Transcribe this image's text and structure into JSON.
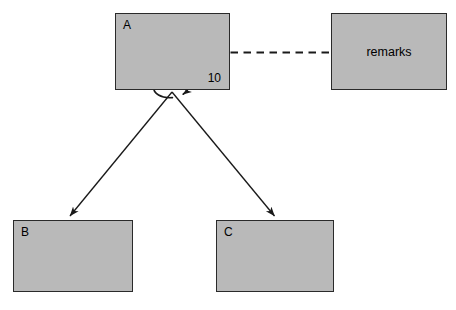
{
  "diagram": {
    "type": "uml-class-diagram",
    "canvas": {
      "width": 456,
      "height": 310,
      "background": "#ffffff"
    },
    "style": {
      "node_fill": "#b9b9b9",
      "node_border": "#2a2a2a",
      "edge_color": "#1a1a1a",
      "text_color": "#000000"
    },
    "nodes": [
      {
        "id": "A",
        "label": "A",
        "label_position": "top-left",
        "multiplicity": "10",
        "multiplicity_position": "bottom-right",
        "x": 115,
        "y": 13,
        "width": 115,
        "height": 77
      },
      {
        "id": "remarks",
        "label": "remarks",
        "label_position": "center",
        "x": 331,
        "y": 13,
        "width": 116,
        "height": 77
      },
      {
        "id": "B",
        "label": "B",
        "label_position": "top-left",
        "x": 13,
        "y": 220,
        "width": 120,
        "height": 72
      },
      {
        "id": "C",
        "label": "C",
        "label_position": "top-left",
        "x": 216,
        "y": 220,
        "width": 118,
        "height": 72
      }
    ],
    "edges": [
      {
        "id": "a-to-remarks",
        "from": "A",
        "to": "remarks",
        "style": "dashed",
        "arrow": "none",
        "kind": "note-anchor"
      },
      {
        "id": "a-self-loop",
        "from": "A",
        "to": "A",
        "style": "solid",
        "arrow": "open-arrowhead",
        "kind": "self-association"
      },
      {
        "id": "a-to-b",
        "from": "A",
        "to": "B",
        "style": "solid",
        "arrow": "filled-arrowhead",
        "kind": "association"
      },
      {
        "id": "a-to-c",
        "from": "A",
        "to": "C",
        "style": "solid",
        "arrow": "filled-arrowhead",
        "kind": "association"
      }
    ]
  }
}
